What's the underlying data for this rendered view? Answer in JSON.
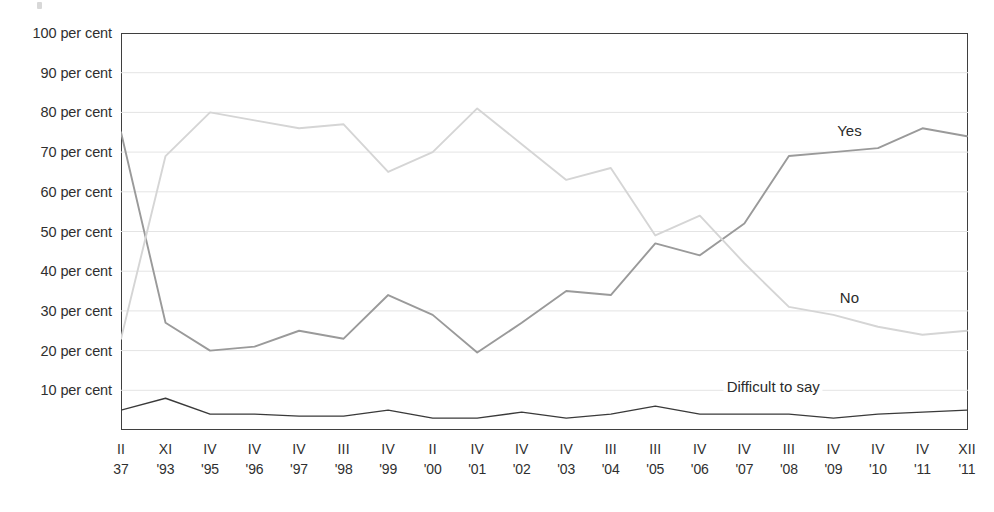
{
  "chart_data": {
    "type": "line",
    "title": "",
    "subtitle": "",
    "xlabel": "",
    "ylabel": "",
    "ylim": [
      0,
      100
    ],
    "ytick_step": 10,
    "grid": true,
    "grid_orientation": "horizontal",
    "legend": "inline-labels",
    "y_tick_labels": [
      "100 per cent",
      "90 per cent",
      "80 per cent",
      "70 per cent",
      "60 per cent",
      "50 per cent",
      "40 per cent",
      "30 per cent",
      "20 per cent",
      "10 per cent"
    ],
    "y_tick_values": [
      100,
      90,
      80,
      70,
      60,
      50,
      40,
      30,
      20,
      10
    ],
    "categories": [
      "II '87",
      "XI '93",
      "IV '95",
      "IV '96",
      "IV '97",
      "III '98",
      "IV '99",
      "II '00",
      "IV '01",
      "IV '02",
      "IV '03",
      "III '04",
      "III '05",
      "IV '06",
      "IV '07",
      "III '08",
      "IV '09",
      "IV '10",
      "IV '11",
      "XII '11"
    ],
    "x_tick_romans": [
      "II",
      "XI",
      "IV",
      "IV",
      "IV",
      "III",
      "IV",
      "II",
      "IV",
      "IV",
      "IV",
      "III",
      "III",
      "IV",
      "IV",
      "III",
      "IV",
      "IV",
      "IV",
      "XII"
    ],
    "x_tick_years": [
      "37",
      "'93",
      "'95",
      "'96",
      "'97",
      "'98",
      "'99",
      "'00",
      "'01",
      "'02",
      "'03",
      "'04",
      "'05",
      "'06",
      "'07",
      "'08",
      "'09",
      "'10",
      "'11",
      "'11"
    ],
    "series": [
      {
        "name": "Yes",
        "color": "#9a9a9a",
        "label_x_pct": 86.0,
        "label_y_pct": 75.5,
        "values": [
          75,
          27,
          20,
          21,
          25,
          23,
          34,
          29,
          19.5,
          27,
          35,
          34,
          47,
          44,
          52,
          69,
          70,
          71,
          76,
          74
        ]
      },
      {
        "name": "No",
        "color": "#d5d5d5",
        "label_x_pct": 86.0,
        "label_y_pct": 33.5,
        "values": [
          23,
          69,
          80,
          78,
          76,
          77,
          65,
          70,
          81,
          72,
          63,
          66,
          49,
          54,
          42,
          31,
          29,
          26,
          24,
          25
        ]
      },
      {
        "name": "Difficult to say",
        "color": "#3a3a3a",
        "label_x_pct": 77.0,
        "label_y_pct": 11.0,
        "values": [
          5,
          8,
          4,
          4,
          3.5,
          3.5,
          5,
          3,
          3,
          4.5,
          3,
          4,
          6,
          4,
          4,
          4,
          3,
          4,
          4.5,
          5
        ]
      }
    ]
  }
}
